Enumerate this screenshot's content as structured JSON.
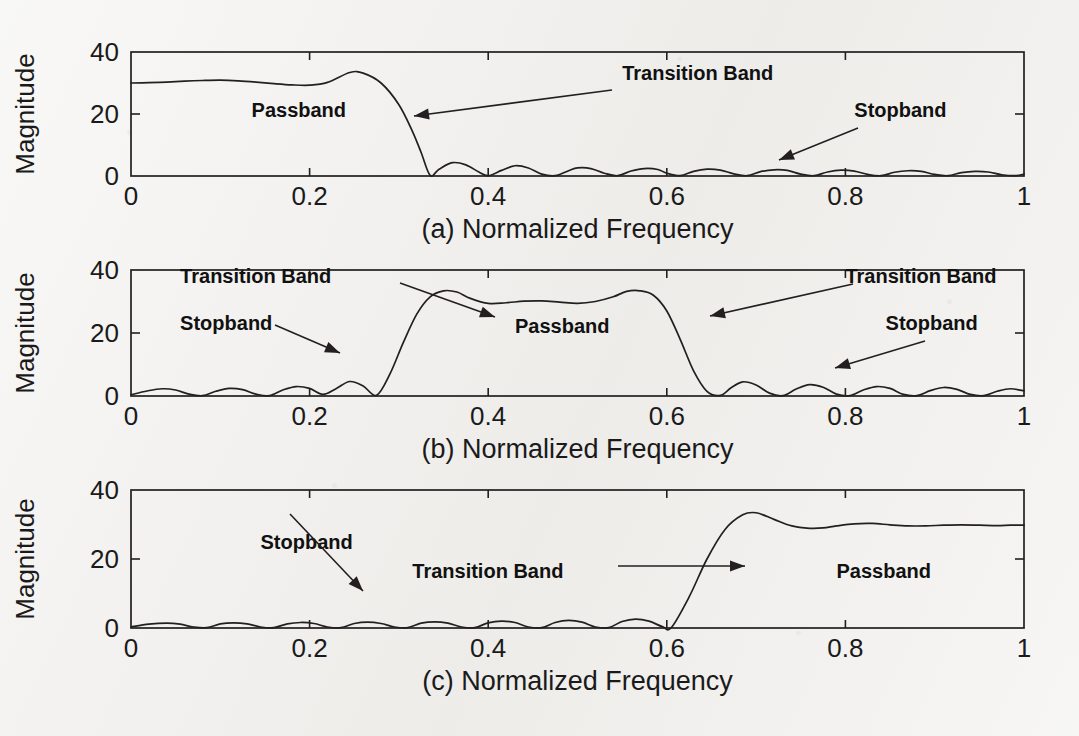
{
  "figure": {
    "background_color": "#f2f1ee",
    "ink_color": "#231f20",
    "panel_count": 3
  },
  "panels": [
    {
      "id": "a",
      "xlabel": "(a) Normalized Frequency",
      "ylabel": "Magnitude",
      "xticks": [
        "0",
        "0.2",
        "0.4",
        "0.6",
        "0.8",
        "1"
      ],
      "yticks": [
        "0",
        "20",
        "40"
      ],
      "annotations": [
        {
          "label": "Passband",
          "name": "passband-label"
        },
        {
          "label": "Transition Band",
          "name": "transition-band-label"
        },
        {
          "label": "Stopband",
          "name": "stopband-label"
        }
      ]
    },
    {
      "id": "b",
      "xlabel": "(b) Normalized Frequency",
      "ylabel": "Magnitude",
      "xticks": [
        "0",
        "0.2",
        "0.4",
        "0.6",
        "0.8",
        "1"
      ],
      "yticks": [
        "0",
        "20",
        "40"
      ],
      "annotations": [
        {
          "label": "Transition Band",
          "name": "transition-band-label-left"
        },
        {
          "label": "Stopband",
          "name": "stopband-label-left"
        },
        {
          "label": "Passband",
          "name": "passband-label"
        },
        {
          "label": "Transition Band",
          "name": "transition-band-label-right"
        },
        {
          "label": "Stopband",
          "name": "stopband-label-right"
        }
      ]
    },
    {
      "id": "c",
      "xlabel": "(c) Normalized Frequency",
      "ylabel": "Magnitude",
      "xticks": [
        "0",
        "0.2",
        "0.4",
        "0.6",
        "0.8",
        "1"
      ],
      "yticks": [
        "0",
        "20",
        "40"
      ],
      "annotations": [
        {
          "label": "Stopband",
          "name": "stopband-label"
        },
        {
          "label": "Transition Band",
          "name": "transition-band-label"
        },
        {
          "label": "Passband",
          "name": "passband-label"
        }
      ]
    }
  ],
  "chart_data": [
    {
      "type": "line",
      "panel": "a",
      "title": "",
      "filter_type": "lowpass",
      "xlabel": "(a) Normalized Frequency",
      "ylabel": "Magnitude",
      "xlim": [
        0,
        1
      ],
      "ylim": [
        0,
        40
      ],
      "xticks": [
        0,
        0.2,
        0.4,
        0.6,
        0.8,
        1
      ],
      "yticks": [
        0,
        20,
        40
      ],
      "grid": false,
      "legend": "none",
      "passband_edge": 0.27,
      "stopband_edge": 0.335,
      "passband_level": 30,
      "passband_peak": 33.5,
      "x": [
        0,
        0.02,
        0.04,
        0.06,
        0.08,
        0.1,
        0.12,
        0.14,
        0.16,
        0.18,
        0.2,
        0.22,
        0.245,
        0.26,
        0.28,
        0.3,
        0.315,
        0.325,
        0.335,
        0.345,
        0.36,
        0.375,
        0.39,
        0.4,
        0.415,
        0.43,
        0.445,
        0.46,
        0.475,
        0.49,
        0.5,
        0.515,
        0.53,
        0.545,
        0.56,
        0.575,
        0.59,
        0.6,
        0.615,
        0.63,
        0.645,
        0.66,
        0.675,
        0.69,
        0.705,
        0.72,
        0.735,
        0.75,
        0.765,
        0.78,
        0.795,
        0.81,
        0.825,
        0.84,
        0.855,
        0.87,
        0.885,
        0.9,
        0.915,
        0.93,
        0.945,
        0.96,
        0.975,
        0.99,
        1.0
      ],
      "y": [
        30.0,
        30.1,
        30.3,
        30.6,
        30.8,
        30.9,
        30.7,
        30.3,
        29.8,
        29.4,
        29.3,
        30.2,
        33.4,
        33.2,
        30.0,
        23.0,
        14.5,
        7.5,
        0.2,
        2.2,
        4.3,
        3.6,
        1.2,
        0.1,
        1.8,
        3.3,
        2.6,
        0.6,
        0.1,
        1.7,
        2.6,
        2.4,
        0.9,
        0.1,
        1.6,
        2.4,
        2.1,
        0.9,
        0.1,
        1.5,
        2.2,
        1.9,
        0.7,
        0.1,
        1.4,
        2.0,
        1.8,
        0.6,
        0.1,
        1.3,
        1.9,
        1.6,
        0.5,
        0.1,
        1.2,
        1.7,
        1.5,
        0.5,
        0.1,
        1.1,
        1.5,
        1.3,
        0.4,
        0.1,
        0.6
      ],
      "annotations": [
        {
          "text": "Passband",
          "x": 0.135,
          "y": 19
        },
        {
          "text": "Transition Band",
          "x": 0.55,
          "y": 31
        },
        {
          "text": "Stopband",
          "x": 0.81,
          "y": 19
        }
      ]
    },
    {
      "type": "line",
      "panel": "b",
      "title": "",
      "filter_type": "bandpass",
      "xlabel": "(b) Normalized Frequency",
      "ylabel": "Magnitude",
      "xlim": [
        0,
        1
      ],
      "ylim": [
        0,
        40
      ],
      "xticks": [
        0,
        0.2,
        0.4,
        0.6,
        0.8,
        1
      ],
      "yticks": [
        0,
        20,
        40
      ],
      "grid": false,
      "legend": "none",
      "passband_range": [
        0.335,
        0.585
      ],
      "passband_level": 30,
      "passband_peak": 33.5,
      "x": [
        0,
        0.018,
        0.035,
        0.05,
        0.065,
        0.08,
        0.095,
        0.11,
        0.125,
        0.14,
        0.155,
        0.17,
        0.185,
        0.2,
        0.215,
        0.23,
        0.245,
        0.26,
        0.275,
        0.29,
        0.305,
        0.32,
        0.335,
        0.35,
        0.365,
        0.38,
        0.4,
        0.42,
        0.44,
        0.46,
        0.48,
        0.5,
        0.52,
        0.54,
        0.555,
        0.57,
        0.585,
        0.6,
        0.615,
        0.63,
        0.645,
        0.66,
        0.672,
        0.685,
        0.7,
        0.715,
        0.73,
        0.745,
        0.76,
        0.775,
        0.79,
        0.805,
        0.82,
        0.835,
        0.85,
        0.865,
        0.88,
        0.895,
        0.91,
        0.925,
        0.94,
        0.955,
        0.97,
        0.985,
        1.0
      ],
      "y": [
        0.4,
        1.6,
        2.3,
        1.9,
        0.6,
        0.1,
        1.5,
        2.4,
        2.0,
        0.6,
        0.1,
        1.9,
        3.0,
        2.4,
        0.5,
        2.4,
        4.6,
        3.2,
        0.2,
        7.0,
        17.0,
        26.0,
        31.5,
        33.4,
        33.0,
        31.0,
        29.4,
        29.6,
        30.1,
        30.2,
        29.8,
        29.4,
        30.0,
        31.5,
        33.2,
        33.4,
        32.0,
        27.0,
        18.0,
        8.0,
        1.5,
        0.2,
        2.6,
        4.5,
        3.5,
        0.9,
        0.1,
        2.2,
        3.6,
        2.8,
        0.6,
        0.1,
        1.9,
        3.0,
        2.4,
        0.5,
        0.1,
        1.7,
        2.7,
        2.1,
        0.5,
        0.1,
        1.5,
        2.3,
        1.6
      ],
      "annotations": [
        {
          "text": "Transition Band",
          "x": 0.055,
          "y": 36
        },
        {
          "text": "Stopband",
          "x": 0.055,
          "y": 21
        },
        {
          "text": "Passband",
          "x": 0.43,
          "y": 20
        },
        {
          "text": "Transition Band",
          "x": 0.8,
          "y": 36
        },
        {
          "text": "Stopband",
          "x": 0.845,
          "y": 21
        }
      ]
    },
    {
      "type": "line",
      "panel": "c",
      "title": "",
      "filter_type": "highpass",
      "xlabel": "(c) Normalized Frequency",
      "ylabel": "Magnitude",
      "xlim": [
        0,
        1
      ],
      "ylim": [
        0,
        40
      ],
      "xticks": [
        0,
        0.2,
        0.4,
        0.6,
        0.8,
        1
      ],
      "yticks": [
        0,
        20,
        40
      ],
      "grid": false,
      "legend": "none",
      "stopband_edge": 0.605,
      "passband_edge": 0.665,
      "passband_level": 29.8,
      "passband_peak": 33.5,
      "x": [
        0,
        0.02,
        0.04,
        0.055,
        0.07,
        0.085,
        0.1,
        0.115,
        0.13,
        0.145,
        0.16,
        0.175,
        0.19,
        0.205,
        0.22,
        0.235,
        0.25,
        0.265,
        0.28,
        0.295,
        0.31,
        0.325,
        0.34,
        0.355,
        0.37,
        0.385,
        0.4,
        0.415,
        0.43,
        0.445,
        0.46,
        0.475,
        0.49,
        0.505,
        0.52,
        0.535,
        0.55,
        0.565,
        0.58,
        0.595,
        0.605,
        0.625,
        0.645,
        0.665,
        0.685,
        0.7,
        0.72,
        0.74,
        0.76,
        0.775,
        0.79,
        0.81,
        0.83,
        0.85,
        0.87,
        0.89,
        0.91,
        0.93,
        0.95,
        0.97,
        0.985,
        1.0
      ],
      "y": [
        0.3,
        1.1,
        1.4,
        1.1,
        0.3,
        0.1,
        1.2,
        1.5,
        1.2,
        0.3,
        0.1,
        1.2,
        1.6,
        1.3,
        0.3,
        0.1,
        1.3,
        1.7,
        1.3,
        0.3,
        0.1,
        1.4,
        1.8,
        1.4,
        0.3,
        0.1,
        1.5,
        2.0,
        1.6,
        0.3,
        0.1,
        1.6,
        2.2,
        1.7,
        0.3,
        0.1,
        1.9,
        2.6,
        2.0,
        0.4,
        0.1,
        9.0,
        20.0,
        28.5,
        32.8,
        33.4,
        31.5,
        29.6,
        28.9,
        29.0,
        29.6,
        30.2,
        30.3,
        29.9,
        29.6,
        29.6,
        29.8,
        29.9,
        29.8,
        29.7,
        29.8,
        29.8
      ],
      "annotations": [
        {
          "text": "Stopband",
          "x": 0.145,
          "y": 23
        },
        {
          "text": "Transition Band",
          "x": 0.315,
          "y": 14.5
        },
        {
          "text": "Passband",
          "x": 0.79,
          "y": 14.5
        }
      ]
    }
  ]
}
